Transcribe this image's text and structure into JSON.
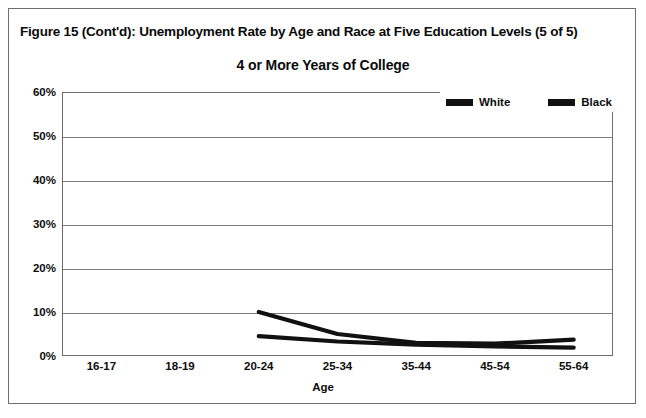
{
  "figure": {
    "title": "Figure 15 (Cont'd): Unemployment Rate by Age and Race at Five Education Levels (5 of 5)"
  },
  "chart_data": {
    "type": "line",
    "title": "4 or More Years of College",
    "xlabel": "Age",
    "ylabel": "",
    "categories": [
      "16-17",
      "18-19",
      "20-24",
      "25-34",
      "35-44",
      "45-54",
      "55-64"
    ],
    "ylim": [
      0,
      60
    ],
    "ytick_values": [
      0,
      10,
      20,
      30,
      40,
      50,
      60
    ],
    "ytick_labels": [
      "0%",
      "10%",
      "20%",
      "30%",
      "40%",
      "50%",
      "60%"
    ],
    "grid": true,
    "legend_position": "top-right",
    "series": [
      {
        "name": "White",
        "color": "#111111",
        "values": [
          null,
          null,
          4.5,
          3.3,
          2.6,
          2.2,
          1.9
        ]
      },
      {
        "name": "Black",
        "color": "#111111",
        "values": [
          null,
          null,
          10.0,
          5.0,
          3.0,
          2.8,
          3.7
        ]
      }
    ]
  },
  "legend": {
    "entries": [
      {
        "label": "White",
        "swatch": "line-swatch"
      },
      {
        "label": "Black",
        "swatch": "line-swatch"
      }
    ]
  }
}
